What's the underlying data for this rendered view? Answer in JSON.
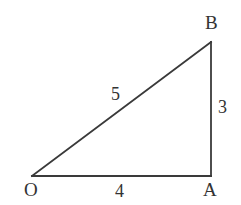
{
  "figure": {
    "type": "right-triangle",
    "background_color": "#ffffff",
    "stroke_color": "#3a3a3a",
    "text_color": "#333333",
    "stroke_width": 1.8,
    "vertices": [
      {
        "name": "O",
        "label": "O",
        "x": 32,
        "y": 176,
        "role": "right-angle-free-vertex"
      },
      {
        "name": "A",
        "label": "A",
        "x": 211,
        "y": 176,
        "role": "right-angle-vertex"
      },
      {
        "name": "B",
        "label": "B",
        "x": 211,
        "y": 42,
        "role": "apex"
      }
    ],
    "sides": [
      {
        "name": "OB",
        "label": "5",
        "kind": "hypotenuse",
        "from": "O",
        "to": "B"
      },
      {
        "name": "AB",
        "label": "3",
        "kind": "vertical-leg",
        "from": "A",
        "to": "B"
      },
      {
        "name": "OA",
        "label": "4",
        "kind": "horizontal-leg",
        "from": "O",
        "to": "A"
      }
    ],
    "labels": {
      "vertex_O": "O",
      "vertex_A": "A",
      "vertex_B": "B",
      "side_hypotenuse": "5",
      "side_vertical": "3",
      "side_base": "4"
    }
  },
  "chart_data": {
    "type": "diagram",
    "title": "",
    "shape": "right triangle",
    "points": {
      "O": [
        0,
        0
      ],
      "A": [
        4,
        0
      ],
      "B": [
        4,
        3
      ]
    },
    "edge_lengths": {
      "OA": 4,
      "AB": 3,
      "OB": 5
    },
    "annotations": [
      "O",
      "A",
      "B",
      "5",
      "3",
      "4"
    ]
  }
}
